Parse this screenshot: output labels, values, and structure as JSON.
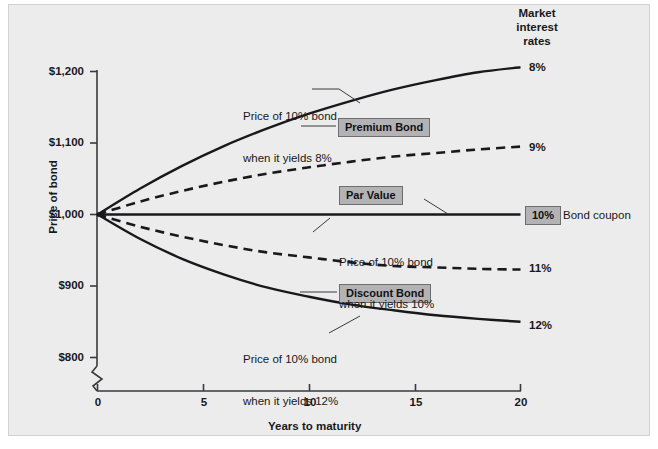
{
  "chart_data": {
    "type": "line",
    "title": "",
    "xlabel": "Years to maturity",
    "ylabel": "Price of bond",
    "xlim": [
      0,
      20
    ],
    "ylim": [
      800,
      1200
    ],
    "x_ticks": [
      "0",
      "5",
      "10",
      "15",
      "20"
    ],
    "x_tick_values": [
      0,
      5,
      10,
      15,
      20
    ],
    "y_ticks": [
      "$800",
      "$900",
      "$1,000",
      "$1,100",
      "$1,200"
    ],
    "y_tick_values": [
      800,
      900,
      1000,
      1100,
      1200
    ],
    "y_axis_break": true,
    "grid": false,
    "legend_position": "right-of-plot",
    "legend_title": "Market\ninterest\nrates",
    "x": [
      0,
      2,
      4,
      6,
      8,
      10,
      12,
      14,
      16,
      18,
      20
    ],
    "series": [
      {
        "name": "8%",
        "style": "solid",
        "end_label": "8%",
        "values": [
          1000,
          1036,
          1068,
          1096,
          1120,
          1141,
          1159,
          1175,
          1188,
          1199,
          1206
        ]
      },
      {
        "name": "9%",
        "style": "dashed",
        "end_label": "9%",
        "values": [
          1000,
          1018,
          1033,
          1046,
          1057,
          1066,
          1074,
          1081,
          1086,
          1091,
          1095
        ]
      },
      {
        "name": "10%",
        "style": "solid",
        "end_label": "10%",
        "values": [
          1000,
          1000,
          1000,
          1000,
          1000,
          1000,
          1000,
          1000,
          1000,
          1000,
          1000
        ]
      },
      {
        "name": "11%",
        "style": "dashed",
        "end_label": "11%",
        "values": [
          1000,
          983,
          969,
          957,
          947,
          940,
          933,
          928,
          926,
          924,
          923
        ]
      },
      {
        "name": "12%",
        "style": "solid",
        "end_label": "12%",
        "values": [
          1000,
          966,
          938,
          916,
          898,
          885,
          874,
          866,
          859,
          854,
          850
        ]
      }
    ],
    "annotations": [
      {
        "name": "premium-bond-box",
        "text": "Premium Bond"
      },
      {
        "name": "par-value-box",
        "text": "Par Value"
      },
      {
        "name": "discount-bond-box",
        "text": "Discount Bond"
      },
      {
        "name": "bond-coupon-box",
        "text": "10%"
      },
      {
        "name": "callout-8",
        "text": "Price of 10% bond\nwhen it yields 8%"
      },
      {
        "name": "callout-10",
        "text": "Price of 10% bond\nwhen it yields 10%"
      },
      {
        "name": "callout-12",
        "text": "Price of 10% bond\nwhen it yields 12%"
      },
      {
        "name": "bond-coupon-label",
        "text": "Bond coupon"
      }
    ]
  },
  "axes": {
    "y_label": "Price of bond",
    "x_label": "Years to maturity",
    "y_tick_1200": "$1,200",
    "y_tick_1100": "$1,100",
    "y_tick_1000": "$1,000",
    "y_tick_900": "$900",
    "y_tick_800": "$800",
    "x_tick_0": "0",
    "x_tick_5": "5",
    "x_tick_10": "10",
    "x_tick_15": "15",
    "x_tick_20": "20"
  },
  "legend": {
    "header_line1": "Market",
    "header_line2": "interest",
    "header_line3": "rates",
    "rate_8": "8%",
    "rate_9": "9%",
    "rate_10": "10%",
    "rate_11": "11%",
    "rate_12": "12%",
    "bond_coupon": "Bond coupon"
  },
  "annotations": {
    "premium_bond": "Premium Bond",
    "par_value": "Par Value",
    "discount_bond": "Discount Bond",
    "callout_8_line1": "Price of 10% bond",
    "callout_8_line2": "when it yields 8%",
    "callout_10_line1": "Price of 10% bond",
    "callout_10_line2": "when it yields 10%",
    "callout_12_line1": "Price of 10% bond",
    "callout_12_line2": "when it yields 12%"
  },
  "colors": {
    "panel_bg": "#ececed",
    "curve": "#19191b",
    "box_fill": "#b3b3b5",
    "box_border": "#6e6e70",
    "axis": "#3a3a3c"
  }
}
